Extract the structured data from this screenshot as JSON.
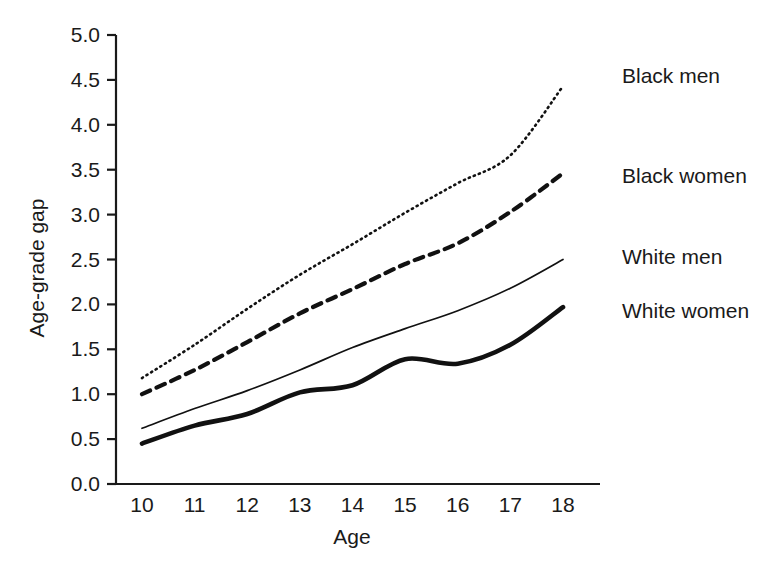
{
  "chart_data": {
    "type": "line",
    "title": "",
    "xlabel": "Age",
    "ylabel": "Age-grade gap",
    "x": [
      10,
      11,
      12,
      13,
      14,
      15,
      16,
      17,
      18
    ],
    "xlim": [
      10,
      18
    ],
    "ylim": [
      0.0,
      5.0
    ],
    "xticks": [
      "10",
      "11",
      "12",
      "13",
      "14",
      "15",
      "16",
      "17",
      "18"
    ],
    "yticks": [
      "0.0",
      "0.5",
      "1.0",
      "1.5",
      "2.0",
      "2.5",
      "3.0",
      "3.5",
      "4.0",
      "4.5",
      "5.0"
    ],
    "grid": false,
    "legend_position": "right-of-plot-inline-labels",
    "series": [
      {
        "name": "Black men",
        "style": "dotted",
        "color": "#111111",
        "values": [
          1.18,
          1.55,
          1.95,
          2.33,
          2.67,
          3.02,
          3.35,
          3.66,
          4.43
        ]
      },
      {
        "name": "Black women",
        "style": "dashed",
        "color": "#111111",
        "values": [
          1.0,
          1.27,
          1.58,
          1.9,
          2.17,
          2.45,
          2.68,
          3.03,
          3.46
        ]
      },
      {
        "name": "White men",
        "style": "solid-thin",
        "color": "#111111",
        "values": [
          0.62,
          0.84,
          1.04,
          1.27,
          1.52,
          1.73,
          1.93,
          2.18,
          2.5
        ]
      },
      {
        "name": "White women",
        "style": "solid-thick",
        "color": "#111111",
        "values": [
          0.45,
          0.65,
          0.78,
          1.02,
          1.1,
          1.39,
          1.34,
          1.55,
          1.97
        ]
      }
    ]
  },
  "axes": {
    "ylabel": "Age-grade gap",
    "xlabel": "Age",
    "yticks": [
      {
        "label": "5.0",
        "value": 5.0
      },
      {
        "label": "4.5",
        "value": 4.5
      },
      {
        "label": "4.0",
        "value": 4.0
      },
      {
        "label": "3.5",
        "value": 3.5
      },
      {
        "label": "3.0",
        "value": 3.0
      },
      {
        "label": "2.5",
        "value": 2.5
      },
      {
        "label": "2.0",
        "value": 2.0
      },
      {
        "label": "1.5",
        "value": 1.5
      },
      {
        "label": "1.0",
        "value": 1.0
      },
      {
        "label": "0.5",
        "value": 0.5
      },
      {
        "label": "0.0",
        "value": 0.0
      }
    ],
    "xticks": [
      {
        "label": "10",
        "value": 10
      },
      {
        "label": "11",
        "value": 11
      },
      {
        "label": "12",
        "value": 12
      },
      {
        "label": "13",
        "value": 13
      },
      {
        "label": "14",
        "value": 14
      },
      {
        "label": "15",
        "value": 15
      },
      {
        "label": "16",
        "value": 16
      },
      {
        "label": "17",
        "value": 17
      },
      {
        "label": "18",
        "value": 18
      }
    ]
  },
  "labels": {
    "black_men": "Black men",
    "black_women": "Black women",
    "white_men": "White men",
    "white_women": "White women"
  }
}
